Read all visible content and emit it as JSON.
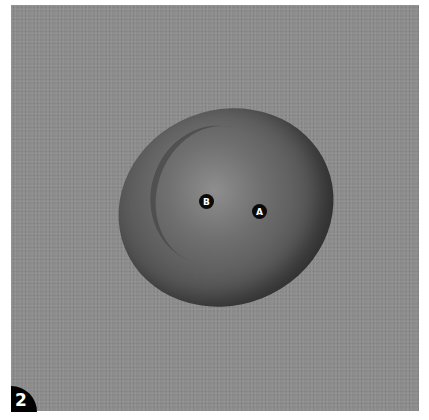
{
  "figure": {
    "number": "2"
  },
  "markers": [
    {
      "label": "B",
      "x": 206,
      "y": 201
    },
    {
      "label": "A",
      "x": 259,
      "y": 211
    }
  ],
  "colors": {
    "background": "#8d8d8d",
    "marker_fill": "#0a0a0a",
    "marker_text": "#ffffff",
    "badge_fill": "#000000"
  }
}
